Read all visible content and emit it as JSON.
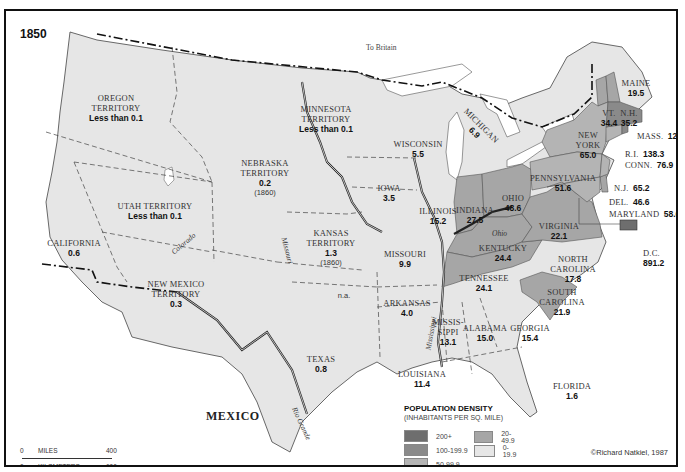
{
  "map": {
    "year": "1850",
    "author_credit": "©Richard Natkiel, 1987",
    "labels": {
      "to_britain": "To Britain",
      "mexico": "MEXICO"
    },
    "rivers": [
      "Missouri",
      "Colorado",
      "Ohio",
      "Mississippi",
      "Rio Grande"
    ],
    "regions": [
      {
        "name": "OREGON TERRITORY",
        "line1": "OREGON",
        "line2": "TERRITORY",
        "density": "Less than 0.1",
        "category": "0-19.9"
      },
      {
        "name": "MINNESOTA TERRITORY",
        "line1": "MINNESOTA",
        "line2": "TERRITORY",
        "density": "Less than 0.1",
        "category": "0-19.9"
      },
      {
        "name": "WISCONSIN",
        "density": "5.5",
        "category": "0-19.9"
      },
      {
        "name": "MICHIGAN",
        "density": "6.9",
        "category": "0-19.9"
      },
      {
        "name": "NEBRASKA TERRITORY",
        "line1": "NEBRASKA",
        "line2": "TERRITORY",
        "density": "0.2",
        "note": "(1860)",
        "category": "0-19.9"
      },
      {
        "name": "IOWA",
        "density": "3.5",
        "category": "0-19.9"
      },
      {
        "name": "ILLINOIS",
        "density": "15.2",
        "category": "0-19.9"
      },
      {
        "name": "INDIANA",
        "density": "27.5",
        "category": "20-49.9"
      },
      {
        "name": "OHIO",
        "density": "48.6",
        "category": "20-49.9"
      },
      {
        "name": "PENNSYLVANIA",
        "density": "51.6",
        "category": "50-99.9"
      },
      {
        "name": "NEW YORK",
        "line1": "NEW",
        "line2": "YORK",
        "density": "65.0",
        "category": "50-99.9"
      },
      {
        "name": "MAINE",
        "density": "19.5",
        "category": "0-19.9"
      },
      {
        "name": "VT.",
        "density": "34.4",
        "category": "20-49.9"
      },
      {
        "name": "N.H.",
        "density": "35.2",
        "category": "20-49.9"
      },
      {
        "name": "MASS.",
        "density": "123.7",
        "category": "100-199.9"
      },
      {
        "name": "R.I.",
        "density": "138.3",
        "category": "100-199.9"
      },
      {
        "name": "CONN.",
        "density": "76.9",
        "category": "50-99.9"
      },
      {
        "name": "N.J.",
        "density": "65.2",
        "category": "50-99.9"
      },
      {
        "name": "DEL.",
        "density": "46.6",
        "category": "20-49.9"
      },
      {
        "name": "MARYLAND",
        "density": "58.6",
        "category": "50-99.9"
      },
      {
        "name": "D.C.",
        "density": "891.2",
        "category": "200+"
      },
      {
        "name": "UTAH TERRITORY",
        "density": "Less than 0.1",
        "category": "0-19.9"
      },
      {
        "name": "CALIFORNIA",
        "density": "0.6",
        "category": "0-19.9"
      },
      {
        "name": "KANSAS TERRITORY",
        "line1": "KANSAS",
        "line2": "TERRITORY",
        "density": "1.3",
        "note": "(1860)",
        "category": "0-19.9"
      },
      {
        "name": "MISSOURI",
        "density": "9.9",
        "category": "0-19.9"
      },
      {
        "name": "KENTUCKY",
        "density": "24.4",
        "category": "20-49.9"
      },
      {
        "name": "VIRGINIA",
        "density": "22.1",
        "category": "20-49.9"
      },
      {
        "name": "NEW MEXICO TERRITORY",
        "line1": "NEW MEXICO",
        "line2": "TERRITORY",
        "density": "0.3",
        "category": "0-19.9"
      },
      {
        "name": "Indian Territory",
        "density": "n.a.",
        "category": "none"
      },
      {
        "name": "ARKANSAS",
        "density": "4.0",
        "category": "0-19.9"
      },
      {
        "name": "TENNESSEE",
        "density": "24.1",
        "category": "20-49.9"
      },
      {
        "name": "NORTH CAROLINA",
        "line1": "NORTH",
        "line2": "CAROLINA",
        "density": "17.8",
        "category": "0-19.9"
      },
      {
        "name": "SOUTH CAROLINA",
        "line1": "SOUTH",
        "line2": "CAROLINA",
        "density": "21.9",
        "category": "20-49.9"
      },
      {
        "name": "TEXAS",
        "density": "0.8",
        "category": "0-19.9"
      },
      {
        "name": "MISSISSIPPI",
        "line1": "MISSIS-",
        "line2": "SIPPI",
        "density": "13.1",
        "category": "0-19.9"
      },
      {
        "name": "ALABAMA",
        "density": "15.0",
        "category": "0-19.9"
      },
      {
        "name": "GEORGIA",
        "density": "15.4",
        "category": "0-19.9"
      },
      {
        "name": "LOUISIANA",
        "density": "11.4",
        "category": "0-19.9"
      },
      {
        "name": "FLORIDA",
        "density": "1.6",
        "category": "0-19.9"
      }
    ]
  },
  "legend": {
    "title": "POPULATION DENSITY",
    "subtitle": "(INHABITANTS PER SQ. MILE)",
    "items": [
      {
        "label": "200+",
        "color": "#6e6e6e"
      },
      {
        "label": "100-199.9",
        "color": "#8a8a8a"
      },
      {
        "label": "50-99.9",
        "color": "#b4b4b4"
      },
      {
        "label": "20-49.9",
        "color": "#a6a6a6"
      },
      {
        "label": "0-19.9",
        "color": "#e6e6e6"
      }
    ]
  },
  "scale_bar": {
    "miles_label": "MILES",
    "km_label": "KILOMETERS",
    "miles_start": "0",
    "miles_end": "400",
    "km_start": "0",
    "km_end": "600"
  },
  "colors": {
    "light": "#e6e6e6",
    "mid": "#a6a6a6",
    "midlight": "#b4b4b4",
    "dark": "#8a8a8a",
    "darkest": "#6e6e6e",
    "water": "#ffffff"
  }
}
